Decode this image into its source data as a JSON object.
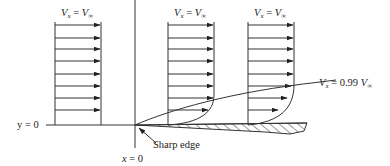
{
  "labels": {
    "profile1": {
      "lhs": "V",
      "lhs_sub": "x",
      "eq": " = ",
      "rhs": "V",
      "rhs_sub": "∞"
    },
    "profile2": {
      "lhs": "V",
      "lhs_sub": "x",
      "eq": " = ",
      "rhs": "V",
      "rhs_sub": "∞"
    },
    "profile3": {
      "lhs": "V",
      "lhs_sub": "x",
      "eq": " = ",
      "rhs": "V",
      "rhs_sub": "∞"
    },
    "bl_edge": {
      "lhs": "V",
      "lhs_sub": "x",
      "eq": " = 0.99 ",
      "rhs": "V",
      "rhs_sub": "∞"
    },
    "y_axis": "y = 0",
    "x_axis": "x = 0",
    "sharp_edge": "Sharp edge"
  },
  "colors": {
    "ink": "#333333",
    "background": "#ffffff"
  }
}
